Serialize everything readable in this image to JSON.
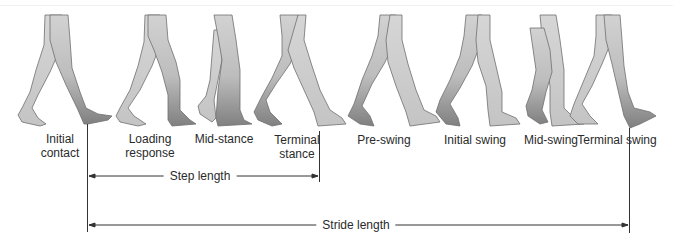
{
  "colors": {
    "leg_light": "#cfcfcf",
    "leg_dark": "#8a8a8a",
    "outline": "#6e6e6e",
    "line": "#333333",
    "text": "#2a2a2a"
  },
  "phases": [
    {
      "label_line1": "Initial",
      "label_line2": "contact",
      "x": 60
    },
    {
      "label_line1": "Loading",
      "label_line2": "response",
      "x": 150
    },
    {
      "label_line1": "Mid-stance",
      "label_line2": "",
      "x": 224
    },
    {
      "label_line1": "Terminal",
      "label_line2": "stance",
      "x": 297
    },
    {
      "label_line1": "Pre-swing",
      "label_line2": "",
      "x": 385
    },
    {
      "label_line1": "Initial swing",
      "label_line2": "",
      "x": 475
    },
    {
      "label_line1": "Mid-swing",
      "label_line2": "",
      "x": 554
    },
    {
      "label_line1": "Terminal swing",
      "label_line2": "",
      "x": 620
    }
  ],
  "measurements": {
    "step_length": {
      "label": "Step length",
      "x_start": 87,
      "x_end": 319,
      "y": 176
    },
    "stride_length": {
      "label": "Stride length",
      "x_start": 87,
      "x_end": 629,
      "y": 225
    }
  }
}
